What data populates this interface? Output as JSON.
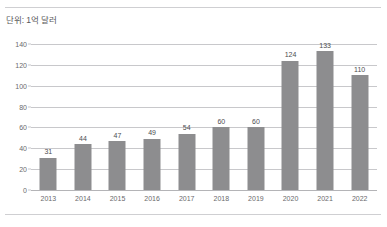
{
  "caption": {
    "unit_label": "단위: 1억 달러"
  },
  "colors": {
    "bar": "#8d8d8f",
    "gridline": "#c8c8cb",
    "rule": "#cfcfd2",
    "tick_text": "#6a6a6c",
    "value_text": "#4d4d4f",
    "background": "#ffffff"
  },
  "chart_data": {
    "type": "bar",
    "title": "",
    "subtitle": "",
    "xlabel": "",
    "ylabel": "단위: 1억 달러",
    "categories": [
      "2013",
      "2014",
      "2015",
      "2016",
      "2017",
      "2018",
      "2019",
      "2020",
      "2021",
      "2022"
    ],
    "values": [
      31,
      44,
      47,
      49,
      54,
      60,
      60,
      124,
      133,
      110
    ],
    "value_labels": [
      "31",
      "44",
      "47",
      "49",
      "54",
      "60",
      "60",
      "124",
      "133",
      "110"
    ],
    "ylim": [
      0,
      140
    ],
    "yticks": [
      0,
      20,
      40,
      60,
      80,
      100,
      120,
      140
    ],
    "ytick_labels": [
      "0",
      "20",
      "40",
      "60",
      "80",
      "100",
      "120",
      "140"
    ],
    "grid": true,
    "grid_axis": "y",
    "legend": false,
    "legend_position": "none"
  }
}
